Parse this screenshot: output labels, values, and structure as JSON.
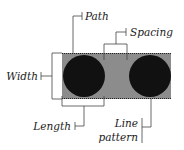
{
  "diagram": {
    "labels": {
      "path": "Path",
      "spacing": "Spacing",
      "width": "Width",
      "length": "Length",
      "line_pattern_1": "Line",
      "line_pattern_2": "pattern"
    },
    "colors": {
      "background": "#ffffff",
      "path_fill": "#8c8c8c",
      "dot_fill": "#111111",
      "leader_line": "#444444",
      "text": "#1a1a1a"
    }
  }
}
